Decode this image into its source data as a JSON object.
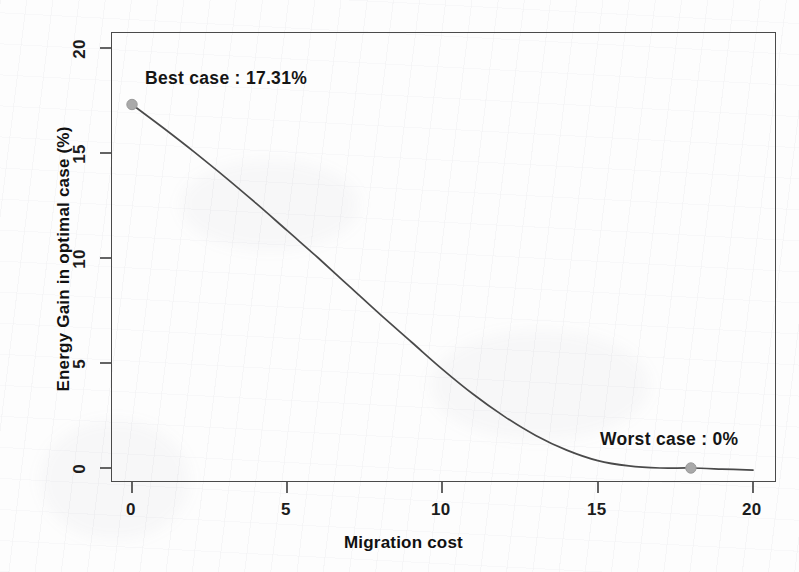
{
  "chart_data": {
    "type": "line",
    "title": "",
    "subtitle": "",
    "xlabel": "Migration cost",
    "ylabel": "Energy Gain in optimal case (%)",
    "xlim": [
      0,
      20
    ],
    "ylim": [
      0,
      20
    ],
    "xticks": [
      0,
      5,
      10,
      15,
      20
    ],
    "xtick_labels": [
      "0",
      "5",
      "10",
      "15",
      "20"
    ],
    "yticks": [
      0,
      5,
      10,
      15,
      20
    ],
    "ytick_labels": [
      "0",
      "5",
      "10",
      "15",
      "20"
    ],
    "grid": false,
    "legend": null,
    "series": [
      {
        "name": "Energy gain vs migration cost",
        "line_color": "#4a4a4a",
        "x": [
          0,
          1,
          2,
          3,
          4,
          5,
          6,
          7,
          8,
          9,
          10,
          11,
          12,
          13,
          14,
          15,
          16,
          17,
          18,
          19,
          20
        ],
        "values": [
          17.31,
          16.2,
          15.05,
          13.85,
          12.6,
          11.3,
          10.0,
          8.65,
          7.3,
          6.0,
          4.7,
          3.5,
          2.45,
          1.55,
          0.85,
          0.35,
          0.1,
          0.0,
          0.0,
          -0.05,
          -0.1
        ]
      }
    ],
    "points": [
      {
        "name": "best-case-point",
        "x": 0,
        "y": 17.31,
        "color": "#a9a9a9"
      },
      {
        "name": "worst-case-point",
        "x": 18,
        "y": 0,
        "color": "#a9a9a9"
      }
    ],
    "annotations": [
      {
        "name": "best-case-label",
        "text": "Best case : 17.31%",
        "x": 0.2,
        "y": 18.6
      },
      {
        "name": "worst-case-label",
        "text": "Worst case : 0%",
        "x": 15.0,
        "y": 1.6
      }
    ]
  }
}
